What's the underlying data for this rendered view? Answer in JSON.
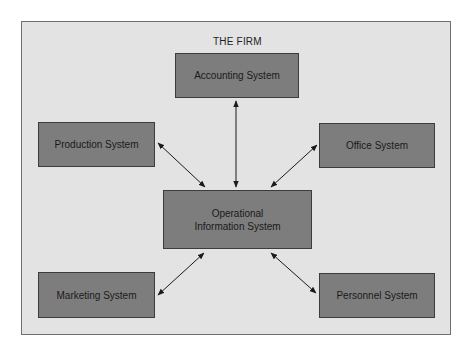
{
  "diagram": {
    "title": "THE FIRM",
    "nodes": {
      "accounting": "Accounting System",
      "production": "Production System",
      "office": "Office System",
      "operational": "Operational Information System",
      "marketing": "Marketing System",
      "personnel": "Personnel System"
    },
    "edges": [
      {
        "from": "operational",
        "to": "accounting",
        "type": "bidirectional"
      },
      {
        "from": "operational",
        "to": "production",
        "type": "bidirectional"
      },
      {
        "from": "operational",
        "to": "office",
        "type": "bidirectional"
      },
      {
        "from": "operational",
        "to": "marketing",
        "type": "bidirectional"
      },
      {
        "from": "operational",
        "to": "personnel",
        "type": "bidirectional"
      }
    ],
    "colors": {
      "frame_fill": "#e3e3e3",
      "box_fill": "#7d7d7d",
      "arrow": "#1a1a1a"
    }
  }
}
